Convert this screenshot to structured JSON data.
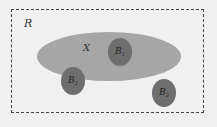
{
  "diagram": {
    "region_label": "R",
    "set_label": "X",
    "circles": [
      {
        "name": "B",
        "sub": "1"
      },
      {
        "name": "B",
        "sub": "2"
      },
      {
        "name": "B",
        "sub": "3"
      }
    ],
    "colors": {
      "background": "#f0f0f0",
      "ellipse": "#a6a6a6",
      "circle": "#6e6e6e",
      "border": "#444444"
    }
  }
}
